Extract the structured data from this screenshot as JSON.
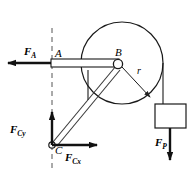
{
  "figure": {
    "type": "engineering-free-body-diagram",
    "stroke_color": "#1a1a1a",
    "fill_color": "#ffffff",
    "background": "#ffffff"
  },
  "points": {
    "A": {
      "label": "A",
      "x": 52,
      "y": 63
    },
    "B": {
      "label": "B",
      "x": 118,
      "y": 65
    },
    "C": {
      "label": "C",
      "x": 52,
      "y": 145
    }
  },
  "dimensions": {
    "radius": {
      "label": "r",
      "symbol": "r"
    }
  },
  "forces": [
    {
      "id": "FA",
      "symbol": "F",
      "subscript": "A",
      "label": "F_A",
      "direction": "left"
    },
    {
      "id": "FCy",
      "symbol": "F",
      "subscript": "Cy",
      "label": "F_Cy",
      "direction": "up"
    },
    {
      "id": "FCx",
      "symbol": "F",
      "subscript": "Cx",
      "label": "F_Cx",
      "direction": "right"
    },
    {
      "id": "FP",
      "symbol": "F",
      "subscript": "P",
      "label": "F_P",
      "direction": "down"
    }
  ],
  "elements": {
    "pulley": {
      "name": "pulley-disk",
      "cx": 122,
      "cy": 63,
      "r": 40
    },
    "beam": {
      "name": "horizontal-beam-AB"
    },
    "brace": {
      "name": "diagonal-member-CB"
    },
    "rope": {
      "name": "rope"
    },
    "block": {
      "name": "hanging-block",
      "x": 155,
      "y": 104,
      "w": 31,
      "h": 24
    },
    "axis": {
      "name": "vertical-dashed-reference-line"
    }
  }
}
